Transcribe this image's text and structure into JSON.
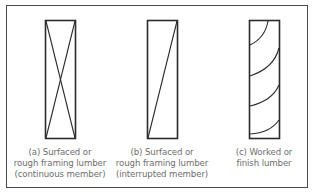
{
  "figure": {
    "panels": [
      {
        "id": "a",
        "marking": "x-cross",
        "caption_lines": [
          "(a) Surfaced or",
          "rough framing lumber",
          "(continuous member)"
        ]
      },
      {
        "id": "b",
        "marking": "single-diagonal",
        "caption_lines": [
          "(b) Surfaced or",
          "rough framing lumber",
          "(interrupted member)"
        ]
      },
      {
        "id": "c",
        "marking": "wood-grain-arcs",
        "caption_lines": [
          "(c) Worked or",
          "finish lumber"
        ]
      }
    ],
    "colors": {
      "line": "#2b2b2b",
      "frame": "#4a4a4a",
      "caption": "#6e6e6e"
    }
  }
}
